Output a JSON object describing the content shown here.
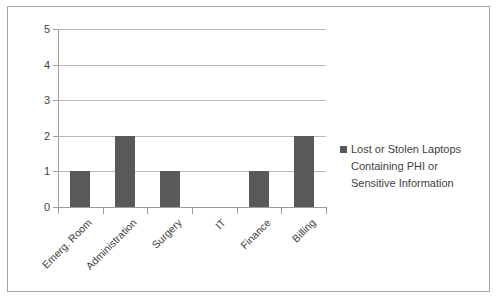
{
  "chart_data": {
    "type": "bar",
    "title": "",
    "subtitle": "",
    "xlabel": "",
    "ylabel": "",
    "categories": [
      "Emerg. Room",
      "Administration",
      "Surgery",
      "IT",
      "Finance",
      "Billing"
    ],
    "values": [
      1,
      2,
      1,
      0,
      1,
      2
    ],
    "series": [
      {
        "name": "Lost or Stolen Laptops Containing PHI or Sensitive Information",
        "values": [
          1,
          2,
          1,
          0,
          1,
          2
        ]
      }
    ],
    "ylim": [
      0,
      5
    ],
    "y_ticks": [
      "0",
      "1",
      "2",
      "3",
      "4",
      "5"
    ],
    "grid": "horizontal",
    "legend_position": "right",
    "legend_lines": [
      "Lost or Stolen Laptops",
      "Containing PHI or",
      "Sensitive Information"
    ],
    "colors": {
      "bar": "#595959",
      "gridline": "#b8b8b8",
      "axis": "#9d9d9d",
      "border": "#a6a6a6",
      "text": "#3f3f3f",
      "background": "#ffffff"
    }
  }
}
